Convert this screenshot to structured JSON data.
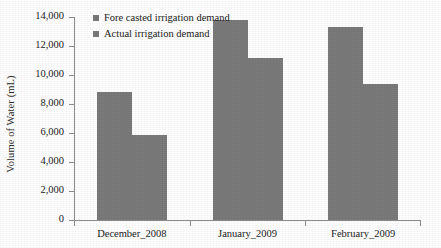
{
  "chart_data": {
    "type": "bar",
    "title": "",
    "xlabel": "",
    "ylabel": "Volume of Water (mL)",
    "categories": [
      "December_2008",
      "January_2009",
      "February_2009"
    ],
    "series": [
      {
        "name": "Fore casted irrigation demand",
        "values": [
          8800,
          13800,
          13300
        ]
      },
      {
        "name": "Actual irrigation demand",
        "values": [
          5850,
          11200,
          9400
        ]
      }
    ],
    "ylim": [
      0,
      14000
    ],
    "ytick_values": [
      0,
      2000,
      4000,
      6000,
      8000,
      10000,
      12000,
      14000
    ],
    "ytick_labels": [
      "0",
      "2,000",
      "4,000",
      "6,000",
      "8,000",
      "10,000",
      "12,000",
      "14,000"
    ],
    "grid": false,
    "legend_position": "top-left",
    "bar_color": "#7a7a7a",
    "axis_color": "#8d8d8d",
    "text_color": "#222222"
  },
  "legend": {
    "entries": [
      {
        "label": "Fore casted irrigation demand"
      },
      {
        "label": "Actual irrigation demand"
      }
    ]
  },
  "axes": {
    "y_label": "Volume of Water (mL)"
  }
}
